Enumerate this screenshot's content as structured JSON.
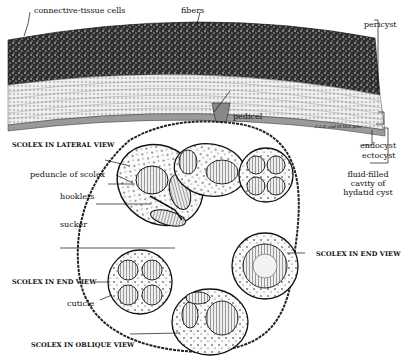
{
  "figure": {
    "artist_credit": "C.L.S. and M.McL.pinx"
  },
  "labels": {
    "connective_tissue_cells": "connective-tissue cells",
    "fibers": "fibers",
    "pericyst": "pericyst",
    "pedicel": "pedicel",
    "endocyst": "endocyst",
    "ectocyst": "ectocyst",
    "cavity_line1": "fluid-filled",
    "cavity_line2": "cavity of",
    "cavity_line3": "hydatid cyst",
    "scolex_lateral": "SCOLEX IN LATERAL VIEW",
    "peduncle": "peduncle of scolex",
    "hooklets": "hooklets",
    "sucker": "sucker",
    "scolex_end_left": "SCOLEX IN END VIEW",
    "scolex_end_right": "SCOLEX IN END VIEW",
    "cuticle": "cuticle",
    "scolex_oblique": "SCOLEX IN OBLIQUE VIEW"
  },
  "colors": {
    "ink": "#111111",
    "pericyst_fill": "#3a3a3a",
    "laminated_fill": "#d8d8d8",
    "paper": "#ffffff"
  }
}
